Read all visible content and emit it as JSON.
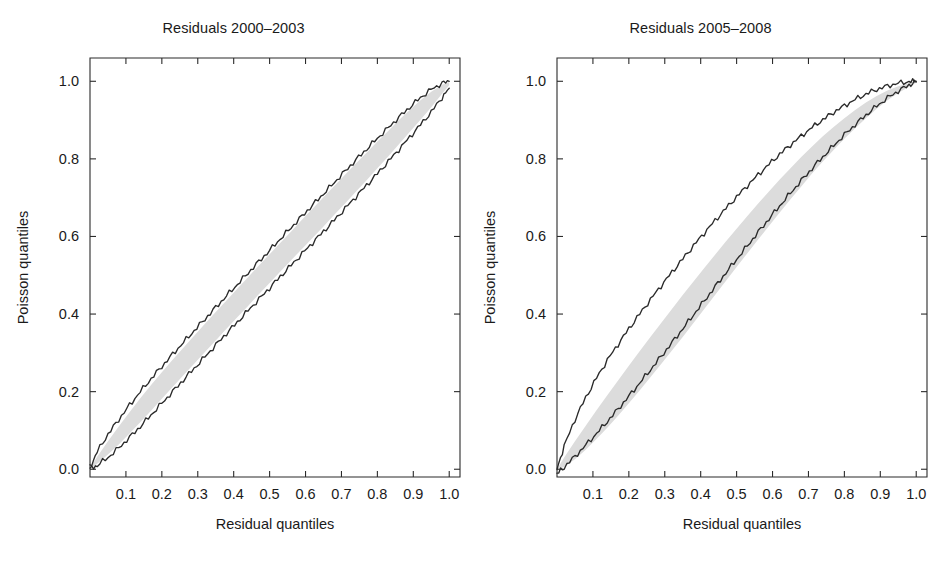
{
  "figure": {
    "background": "#ffffff",
    "band_color": "#dcdcdc",
    "curve_color": "#2a2a2a",
    "axis_color": "#2b2b2b"
  },
  "chart_data": [
    {
      "type": "line",
      "panel": "left",
      "title": "Residuals 2000–2003",
      "xlabel": "Residual quantiles",
      "ylabel": "Poisson quantiles",
      "xlim": [
        0.0,
        1.03
      ],
      "ylim": [
        -0.02,
        1.06
      ],
      "grid": false,
      "legend": "none",
      "xticks": [
        0.1,
        0.2,
        0.3,
        0.4,
        0.5,
        0.6,
        0.7,
        0.8,
        0.9,
        1.0
      ],
      "xticklabels": [
        "0.1",
        "0.2",
        "0.3",
        "0.4",
        "0.5",
        "0.6",
        "0.7",
        "0.8",
        "0.9",
        "1.0"
      ],
      "yticks": [
        0.0,
        0.2,
        0.4,
        0.6,
        0.8,
        1.0
      ],
      "yticklabels": [
        "0.0",
        "0.2",
        "0.4",
        "0.6",
        "0.8",
        "1.0"
      ],
      "x": [
        0.0,
        0.02,
        0.05,
        0.08,
        0.11,
        0.14,
        0.17,
        0.2,
        0.23,
        0.26,
        0.29,
        0.32,
        0.35,
        0.38,
        0.41,
        0.44,
        0.47,
        0.5,
        0.53,
        0.56,
        0.59,
        0.62,
        0.65,
        0.68,
        0.71,
        0.74,
        0.77,
        0.8,
        0.83,
        0.86,
        0.89,
        0.92,
        0.95,
        0.98,
        1.0
      ],
      "series": [
        {
          "name": "upper envelope",
          "values": [
            0.005,
            0.045,
            0.09,
            0.128,
            0.165,
            0.2,
            0.233,
            0.265,
            0.296,
            0.327,
            0.357,
            0.387,
            0.417,
            0.447,
            0.476,
            0.506,
            0.535,
            0.564,
            0.594,
            0.623,
            0.652,
            0.681,
            0.71,
            0.739,
            0.768,
            0.797,
            0.825,
            0.853,
            0.88,
            0.907,
            0.933,
            0.958,
            0.979,
            0.995,
            1.0
          ]
        },
        {
          "name": "lower envelope",
          "values": [
            0.0,
            0.01,
            0.03,
            0.055,
            0.082,
            0.11,
            0.14,
            0.17,
            0.2,
            0.23,
            0.26,
            0.29,
            0.32,
            0.35,
            0.379,
            0.409,
            0.438,
            0.467,
            0.497,
            0.526,
            0.555,
            0.584,
            0.613,
            0.642,
            0.672,
            0.702,
            0.732,
            0.762,
            0.793,
            0.824,
            0.856,
            0.888,
            0.921,
            0.958,
            0.982
          ]
        },
        {
          "name": "band upper",
          "values": [
            0.003,
            0.032,
            0.072,
            0.11,
            0.147,
            0.183,
            0.217,
            0.25,
            0.282,
            0.313,
            0.344,
            0.375,
            0.405,
            0.435,
            0.465,
            0.495,
            0.525,
            0.554,
            0.584,
            0.613,
            0.643,
            0.672,
            0.701,
            0.73,
            0.759,
            0.788,
            0.816,
            0.845,
            0.872,
            0.9,
            0.926,
            0.951,
            0.973,
            0.991,
            0.998
          ]
        },
        {
          "name": "band lower",
          "values": [
            0.0,
            0.014,
            0.038,
            0.064,
            0.092,
            0.121,
            0.151,
            0.182,
            0.212,
            0.242,
            0.272,
            0.302,
            0.332,
            0.362,
            0.392,
            0.421,
            0.451,
            0.48,
            0.51,
            0.539,
            0.568,
            0.597,
            0.626,
            0.656,
            0.685,
            0.715,
            0.745,
            0.776,
            0.806,
            0.838,
            0.869,
            0.901,
            0.933,
            0.968,
            0.99
          ]
        }
      ]
    },
    {
      "type": "line",
      "panel": "right",
      "title": "Residuals 2005–2008",
      "xlabel": "Residual quantiles",
      "ylabel": "Poisson quantiles",
      "xlim": [
        0.0,
        1.03
      ],
      "ylim": [
        -0.02,
        1.06
      ],
      "grid": false,
      "legend": "none",
      "xticks": [
        0.1,
        0.2,
        0.3,
        0.4,
        0.5,
        0.6,
        0.7,
        0.8,
        0.9,
        1.0
      ],
      "xticklabels": [
        "0.1",
        "0.2",
        "0.3",
        "0.4",
        "0.5",
        "0.6",
        "0.7",
        "0.8",
        "0.9",
        "1.0"
      ],
      "yticks": [
        0.0,
        0.2,
        0.4,
        0.6,
        0.8,
        1.0
      ],
      "yticklabels": [
        "0.0",
        "0.2",
        "0.4",
        "0.6",
        "0.8",
        "1.0"
      ],
      "x": [
        0.0,
        0.02,
        0.05,
        0.08,
        0.11,
        0.14,
        0.17,
        0.2,
        0.23,
        0.26,
        0.29,
        0.32,
        0.35,
        0.38,
        0.41,
        0.44,
        0.47,
        0.5,
        0.53,
        0.56,
        0.59,
        0.62,
        0.65,
        0.68,
        0.71,
        0.74,
        0.77,
        0.8,
        0.83,
        0.86,
        0.89,
        0.92,
        0.95,
        0.98,
        1.0
      ],
      "series": [
        {
          "name": "upper envelope",
          "values": [
            0.0,
            0.06,
            0.128,
            0.185,
            0.235,
            0.281,
            0.322,
            0.362,
            0.4,
            0.437,
            0.473,
            0.508,
            0.542,
            0.576,
            0.609,
            0.641,
            0.672,
            0.702,
            0.731,
            0.759,
            0.786,
            0.812,
            0.836,
            0.859,
            0.881,
            0.901,
            0.92,
            0.937,
            0.953,
            0.967,
            0.979,
            0.988,
            0.995,
            0.999,
            1.0
          ]
        },
        {
          "name": "data curve",
          "values": [
            -0.012,
            0.005,
            0.033,
            0.062,
            0.092,
            0.123,
            0.155,
            0.188,
            0.222,
            0.256,
            0.291,
            0.326,
            0.362,
            0.398,
            0.434,
            0.47,
            0.506,
            0.541,
            0.576,
            0.611,
            0.645,
            0.679,
            0.712,
            0.744,
            0.775,
            0.805,
            0.834,
            0.862,
            0.888,
            0.913,
            0.936,
            0.957,
            0.975,
            0.99,
            0.998
          ]
        },
        {
          "name": "band upper",
          "values": [
            0.0,
            0.03,
            0.072,
            0.112,
            0.152,
            0.191,
            0.229,
            0.267,
            0.304,
            0.341,
            0.377,
            0.413,
            0.449,
            0.484,
            0.519,
            0.553,
            0.587,
            0.62,
            0.653,
            0.685,
            0.716,
            0.747,
            0.776,
            0.805,
            0.832,
            0.858,
            0.882,
            0.905,
            0.926,
            0.945,
            0.962,
            0.976,
            0.987,
            0.995,
            1.0
          ]
        },
        {
          "name": "band lower",
          "values": [
            0.0,
            0.006,
            0.026,
            0.05,
            0.078,
            0.107,
            0.138,
            0.17,
            0.203,
            0.237,
            0.271,
            0.306,
            0.341,
            0.377,
            0.413,
            0.449,
            0.485,
            0.521,
            0.557,
            0.592,
            0.627,
            0.662,
            0.696,
            0.729,
            0.762,
            0.793,
            0.823,
            0.852,
            0.879,
            0.905,
            0.929,
            0.951,
            0.97,
            0.986,
            0.996
          ]
        }
      ]
    }
  ]
}
